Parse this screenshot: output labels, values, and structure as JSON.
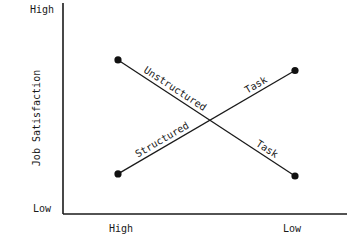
{
  "chart_data": {
    "type": "line",
    "title": "",
    "xlabel": "",
    "ylabel": "Job Satisfaction",
    "x_categories": [
      "High",
      "Low"
    ],
    "y_tick_labels": [
      "Low",
      "High"
    ],
    "ylim": [
      0,
      1
    ],
    "grid": false,
    "legend": "none (inline line labels)",
    "series": [
      {
        "name": "Unstructured Task",
        "label_parts": [
          "Unstructured",
          "Task"
        ],
        "values": [
          0.73,
          0.18
        ]
      },
      {
        "name": "Structured Task",
        "label_parts": [
          "Structured",
          "Task"
        ],
        "values": [
          0.19,
          0.68
        ]
      }
    ]
  }
}
